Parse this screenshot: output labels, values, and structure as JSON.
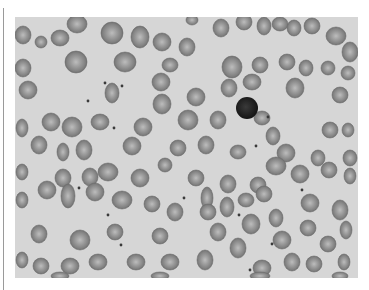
{
  "image": {
    "subject": "peripheral blood smear micrograph",
    "tone": "grayscale",
    "colors": {
      "background": "#d6d6d6",
      "cell_edge": "#6e6e6e",
      "cell_fill": "#8f8f8f",
      "cell_center": "#bdbdbd",
      "lymphocyte": "#1e1e1e",
      "platelet": "#3a3a3a",
      "border_rule": "#9a9a9a"
    },
    "cells": [
      [
        23,
        35,
        8,
        9
      ],
      [
        41,
        42,
        6,
        6
      ],
      [
        60,
        38,
        9,
        8
      ],
      [
        77,
        24,
        10,
        9
      ],
      [
        112,
        33,
        11,
        11
      ],
      [
        140,
        37,
        9,
        11
      ],
      [
        162,
        42,
        9,
        9
      ],
      [
        192,
        20,
        6,
        5
      ],
      [
        221,
        28,
        8,
        9
      ],
      [
        244,
        22,
        8,
        8
      ],
      [
        264,
        26,
        7,
        9
      ],
      [
        280,
        24,
        8,
        7
      ],
      [
        294,
        28,
        7,
        8
      ],
      [
        312,
        26,
        8,
        8
      ],
      [
        336,
        36,
        10,
        9
      ],
      [
        350,
        52,
        8,
        10
      ],
      [
        23,
        68,
        8,
        9
      ],
      [
        76,
        62,
        11,
        11
      ],
      [
        125,
        62,
        11,
        10
      ],
      [
        170,
        65,
        8,
        7
      ],
      [
        187,
        47,
        8,
        9
      ],
      [
        232,
        67,
        10,
        11
      ],
      [
        260,
        65,
        8,
        8
      ],
      [
        287,
        62,
        8,
        8
      ],
      [
        306,
        68,
        7,
        8
      ],
      [
        328,
        68,
        7,
        7
      ],
      [
        348,
        73,
        7,
        7
      ],
      [
        28,
        90,
        9,
        9
      ],
      [
        112,
        93,
        7,
        10
      ],
      [
        161,
        82,
        9,
        9
      ],
      [
        162,
        104,
        9,
        10
      ],
      [
        196,
        97,
        9,
        9
      ],
      [
        229,
        88,
        8,
        9
      ],
      [
        252,
        82,
        9,
        8
      ],
      [
        295,
        88,
        9,
        10
      ],
      [
        340,
        95,
        8,
        8
      ],
      [
        22,
        128,
        6,
        9
      ],
      [
        51,
        122,
        9,
        9
      ],
      [
        72,
        127,
        10,
        10
      ],
      [
        100,
        122,
        9,
        8
      ],
      [
        143,
        127,
        9,
        9
      ],
      [
        188,
        120,
        10,
        10
      ],
      [
        218,
        120,
        8,
        9
      ],
      [
        262,
        118,
        8,
        7
      ],
      [
        273,
        136,
        7,
        9
      ],
      [
        330,
        130,
        8,
        8
      ],
      [
        348,
        130,
        6,
        7
      ],
      [
        39,
        145,
        8,
        9
      ],
      [
        63,
        152,
        6,
        9
      ],
      [
        84,
        150,
        8,
        10
      ],
      [
        132,
        146,
        9,
        9
      ],
      [
        178,
        148,
        8,
        8
      ],
      [
        206,
        145,
        8,
        9
      ],
      [
        238,
        152,
        8,
        7
      ],
      [
        286,
        153,
        9,
        9
      ],
      [
        318,
        158,
        7,
        8
      ],
      [
        350,
        158,
        7,
        8
      ],
      [
        22,
        172,
        6,
        8
      ],
      [
        63,
        178,
        8,
        9
      ],
      [
        90,
        177,
        8,
        9
      ],
      [
        108,
        172,
        10,
        9
      ],
      [
        140,
        178,
        9,
        9
      ],
      [
        165,
        165,
        7,
        7
      ],
      [
        196,
        178,
        8,
        8
      ],
      [
        207,
        198,
        6,
        11
      ],
      [
        228,
        184,
        8,
        9
      ],
      [
        258,
        185,
        8,
        8
      ],
      [
        276,
        166,
        10,
        9
      ],
      [
        300,
        174,
        9,
        9
      ],
      [
        329,
        170,
        8,
        8
      ],
      [
        350,
        176,
        6,
        8
      ],
      [
        22,
        200,
        6,
        8
      ],
      [
        47,
        190,
        9,
        9
      ],
      [
        68,
        196,
        7,
        12
      ],
      [
        95,
        192,
        9,
        9
      ],
      [
        122,
        200,
        10,
        9
      ],
      [
        152,
        204,
        8,
        8
      ],
      [
        175,
        212,
        8,
        9
      ],
      [
        208,
        212,
        8,
        8
      ],
      [
        227,
        207,
        7,
        10
      ],
      [
        246,
        200,
        8,
        7
      ],
      [
        264,
        194,
        8,
        8
      ],
      [
        276,
        218,
        7,
        9
      ],
      [
        310,
        203,
        9,
        9
      ],
      [
        340,
        210,
        8,
        10
      ],
      [
        39,
        234,
        8,
        9
      ],
      [
        80,
        240,
        10,
        10
      ],
      [
        115,
        232,
        8,
        8
      ],
      [
        160,
        236,
        8,
        8
      ],
      [
        218,
        232,
        8,
        9
      ],
      [
        251,
        224,
        9,
        10
      ],
      [
        282,
        240,
        9,
        9
      ],
      [
        308,
        228,
        8,
        8
      ],
      [
        328,
        244,
        8,
        8
      ],
      [
        346,
        230,
        6,
        9
      ],
      [
        22,
        260,
        6,
        8
      ],
      [
        41,
        266,
        8,
        8
      ],
      [
        70,
        266,
        9,
        8
      ],
      [
        98,
        262,
        9,
        8
      ],
      [
        136,
        262,
        9,
        8
      ],
      [
        170,
        262,
        9,
        8
      ],
      [
        205,
        260,
        8,
        10
      ],
      [
        238,
        248,
        8,
        10
      ],
      [
        262,
        268,
        9,
        8
      ],
      [
        292,
        262,
        8,
        9
      ],
      [
        314,
        264,
        8,
        8
      ],
      [
        344,
        262,
        6,
        8
      ],
      [
        60,
        276,
        9,
        4
      ],
      [
        160,
        276,
        9,
        4
      ],
      [
        260,
        276,
        10,
        4
      ],
      [
        340,
        276,
        8,
        4
      ]
    ],
    "lymphocyte": {
      "cx": 247,
      "cy": 108,
      "rx": 11,
      "ry": 11
    },
    "platelets": [
      [
        105,
        83
      ],
      [
        122,
        86
      ],
      [
        88,
        101
      ],
      [
        114,
        128
      ],
      [
        268,
        117
      ],
      [
        256,
        146
      ],
      [
        79,
        188
      ],
      [
        108,
        215
      ],
      [
        121,
        245
      ],
      [
        239,
        215
      ],
      [
        184,
        198
      ],
      [
        272,
        244
      ],
      [
        302,
        190
      ],
      [
        250,
        270
      ]
    ]
  }
}
